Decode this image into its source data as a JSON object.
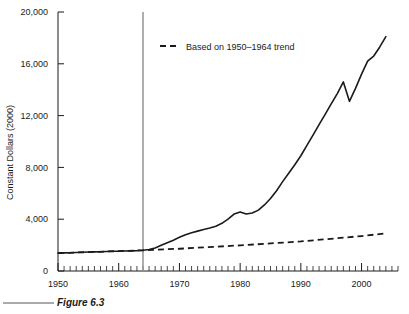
{
  "figure": {
    "caption": "Figure 6.3"
  },
  "chart_data": {
    "type": "line",
    "title": "",
    "xlabel": "",
    "ylabel": "Constant Dollars (2000)",
    "xlim": [
      1950,
      2006
    ],
    "ylim": [
      0,
      20000
    ],
    "grid": false,
    "legend_position": "top-center",
    "xticks": [
      1950,
      1960,
      1970,
      1980,
      1990,
      2000
    ],
    "xtick_labels": [
      "1950",
      "1960",
      "1970",
      "1980",
      "1990",
      "2000"
    ],
    "minor_xtick_interval": 1,
    "yticks": [
      0,
      4000,
      8000,
      12000,
      16000,
      20000
    ],
    "ytick_labels": [
      "0",
      "4,000",
      "8,000",
      "12,000",
      "16,000",
      "20,000"
    ],
    "annotations": [
      {
        "name": "reference-line-1964",
        "type": "vline",
        "x": 1964,
        "color": "#9a9a9a"
      }
    ],
    "legend": [
      {
        "name": "trend-series",
        "label": "Based on 1950–1964 trend",
        "style": "dashed",
        "color": "#1a1a1a"
      }
    ],
    "series": [
      {
        "name": "actual",
        "style": "solid",
        "color": "#1a1a1a",
        "x": [
          1950,
          1951,
          1952,
          1953,
          1954,
          1955,
          1956,
          1957,
          1958,
          1959,
          1960,
          1961,
          1962,
          1963,
          1964,
          1965,
          1966,
          1967,
          1968,
          1969,
          1970,
          1971,
          1972,
          1973,
          1974,
          1975,
          1976,
          1977,
          1978,
          1979,
          1980,
          1981,
          1982,
          1983,
          1984,
          1985,
          1986,
          1987,
          1988,
          1989,
          1990,
          1991,
          1992,
          1993,
          1994,
          1995,
          1996,
          1997,
          1998,
          1999,
          2000,
          2001,
          2002,
          2003,
          2004
        ],
        "values": [
          1380,
          1400,
          1415,
          1430,
          1450,
          1465,
          1475,
          1490,
          1505,
          1520,
          1530,
          1545,
          1555,
          1570,
          1600,
          1660,
          1780,
          1980,
          2180,
          2380,
          2600,
          2800,
          2950,
          3080,
          3200,
          3320,
          3460,
          3680,
          4000,
          4400,
          4560,
          4400,
          4480,
          4700,
          5100,
          5600,
          6200,
          6900,
          7550,
          8200,
          8900,
          9700,
          10500,
          11300,
          12100,
          12900,
          13700,
          14600,
          13100,
          14100,
          15200,
          16200,
          16600,
          17300,
          18100
        ]
      },
      {
        "name": "trend",
        "style": "dashed",
        "color": "#1a1a1a",
        "x": [
          1950,
          1964,
          1970,
          1980,
          1990,
          2000,
          2004
        ],
        "values": [
          1380,
          1600,
          1720,
          1980,
          2280,
          2700,
          2900
        ]
      }
    ]
  }
}
